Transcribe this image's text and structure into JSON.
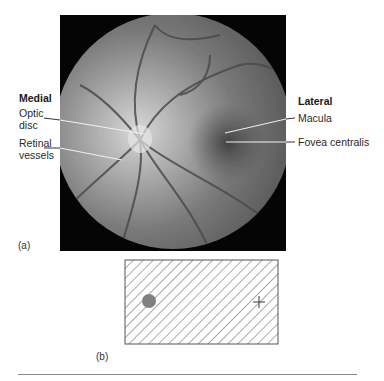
{
  "figure": {
    "photo": {
      "headings": {
        "left": "Medial",
        "right": "Lateral"
      },
      "left_labels": [
        {
          "text_line1": "Optic",
          "text_line2": "disc"
        },
        {
          "text_line1": "Retinal",
          "text_line2": "vessels"
        }
      ],
      "right_labels": [
        {
          "text": "Macula"
        },
        {
          "text": "Fovea centralis"
        }
      ],
      "caption": "(a)"
    },
    "blind_spot_test": {
      "caption": "(b)",
      "dot_color": "#808080",
      "marker": "+"
    }
  }
}
